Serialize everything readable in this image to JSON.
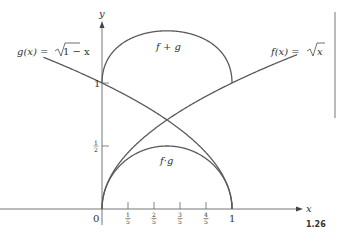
{
  "figure": {
    "number": "1.26",
    "axes": {
      "x_label": "x",
      "y_label": "y",
      "origin_label": "0",
      "x_ticks": [
        {
          "value": 0.2,
          "num": "1",
          "den": "5"
        },
        {
          "value": 0.4,
          "num": "2",
          "den": "5"
        },
        {
          "value": 0.6,
          "num": "3",
          "den": "5"
        },
        {
          "value": 0.8,
          "num": "4",
          "den": "5"
        },
        {
          "value": 1.0,
          "label": "1"
        }
      ],
      "y_ticks": [
        {
          "value": 0.5,
          "num": "1",
          "den": "2"
        },
        {
          "value": 1.0,
          "label": "1"
        }
      ]
    },
    "curves": [
      {
        "name": "g",
        "label": "g(x) = √1−x",
        "expr": "sqrt(1-x)",
        "domain": [
          -0.45,
          1
        ]
      },
      {
        "name": "f",
        "label": "f(x) = √x",
        "expr": "sqrt(x)",
        "domain": [
          0,
          1.5
        ]
      },
      {
        "name": "f+g",
        "label": "f+g",
        "expr": "sqrt(x)+sqrt(1-x)",
        "domain": [
          0,
          1
        ]
      },
      {
        "name": "f·g",
        "label": "f·g",
        "expr": "sqrt(x)*sqrt(1-x)",
        "domain": [
          0,
          1
        ]
      }
    ],
    "labels": {
      "g_prefix": "g(x) = ",
      "g_radicand": "1 − x",
      "f_prefix": "f(x) = ",
      "f_radicand": "x",
      "sum": "f + g",
      "product": "f·g",
      "x": "x",
      "y": "y",
      "zero": "0",
      "one_x": "1",
      "one_y": "1"
    },
    "colors": {
      "curve": "#5a5a5a",
      "axis": "#555555",
      "text": "#333333"
    }
  }
}
